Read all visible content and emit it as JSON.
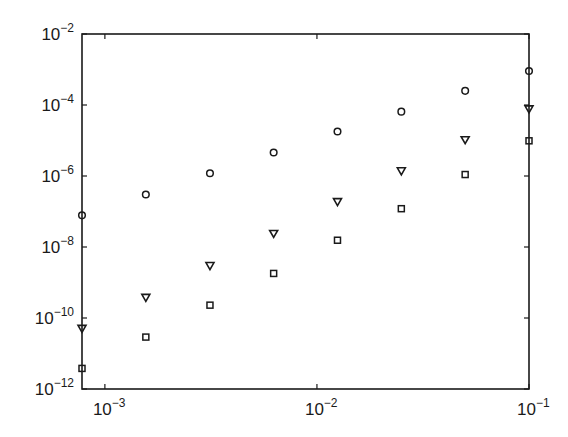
{
  "chart_data": {
    "type": "scatter",
    "title": "",
    "xlabel": "",
    "ylabel": "",
    "xscale": "log",
    "yscale": "log",
    "xlim": [
      0.00078,
      0.1
    ],
    "ylim": [
      1e-12,
      0.01
    ],
    "grid": false,
    "legend": null,
    "x_ticks": [
      {
        "value": 0.001,
        "base": "10",
        "exp": "−3"
      },
      {
        "value": 0.01,
        "base": "10",
        "exp": "−2"
      },
      {
        "value": 0.1,
        "base": "10",
        "exp": "−1"
      }
    ],
    "y_ticks": [
      {
        "value": 0.01,
        "base": "10",
        "exp": "−2"
      },
      {
        "value": 0.0001,
        "base": "10",
        "exp": "−4"
      },
      {
        "value": 1e-06,
        "base": "10",
        "exp": "−6"
      },
      {
        "value": 1e-08,
        "base": "10",
        "exp": "−8"
      },
      {
        "value": 1e-10,
        "base": "10",
        "exp": "−10"
      },
      {
        "value": 1e-12,
        "base": "10",
        "exp": "−12"
      }
    ],
    "x": [
      0.00078,
      0.00156,
      0.00313,
      0.00625,
      0.0125,
      0.025,
      0.05,
      0.1
    ],
    "series": [
      {
        "name": "circles",
        "marker": "circle-open",
        "values": [
          7.8e-08,
          3e-07,
          1.2e-06,
          4.6e-06,
          1.8e-05,
          6.5e-05,
          0.00025,
          0.00091
        ]
      },
      {
        "name": "triangles",
        "marker": "triangle-down-open",
        "values": [
          5.1e-11,
          3.8e-10,
          3e-09,
          2.4e-08,
          1.9e-07,
          1.4e-06,
          1.05e-05,
          7.8e-05
        ]
      },
      {
        "name": "squares",
        "marker": "square-open",
        "values": [
          3.8e-12,
          2.9e-11,
          2.3e-10,
          1.8e-09,
          1.55e-08,
          1.2e-07,
          1.1e-06,
          9.8e-06
        ]
      }
    ]
  },
  "style": {
    "axis_color": "#1a1a1a",
    "marker_color": "#1a1a1a",
    "background": "#ffffff"
  }
}
